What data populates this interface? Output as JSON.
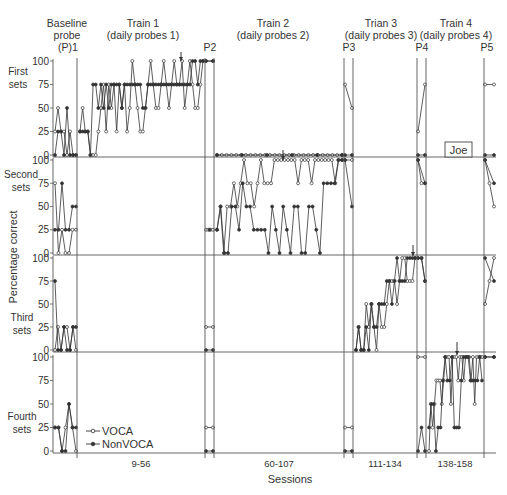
{
  "chart_data": {
    "type": "line",
    "title": "",
    "participant": "Joe",
    "xlabel": "Sessions",
    "ylabel": "Percentage correct",
    "ylim": [
      0,
      100
    ],
    "yticks": [
      0,
      25,
      50,
      75,
      100
    ],
    "grid": false,
    "legend": {
      "position": "lower-left of Fourth sets panel",
      "entries": [
        {
          "name": "VOCA",
          "marker": "open-circle"
        },
        {
          "name": "NonVOCA",
          "marker": "filled-circle"
        }
      ]
    },
    "phases": [
      {
        "id": "baseline",
        "title": "Baseline probe",
        "probe_label": "(P)1",
        "session_range": ""
      },
      {
        "id": "train1",
        "title": "Train 1",
        "subtitle": "(daily probes 1)",
        "probe_label": "P2",
        "session_range": "9-56"
      },
      {
        "id": "train2",
        "title": "Train 2",
        "subtitle": "(daily probes 2)",
        "probe_label": "P3",
        "session_range": "60-107"
      },
      {
        "id": "train3",
        "title": "Trian 3",
        "subtitle": "(daily probes 3)",
        "probe_label": "P4",
        "session_range": "111-134"
      },
      {
        "id": "train4",
        "title": "Train 4",
        "subtitle": "(daily probes 4)",
        "probe_label": "P5",
        "session_range": "138-158"
      }
    ],
    "panels": [
      {
        "name": "First sets",
        "series": [
          {
            "name": "VOCA",
            "segments": {
              "baseline": [
                25,
                50,
                25,
                25,
                0,
                25,
                0,
                0
              ],
              "train1": [
                25,
                50,
                25,
                25,
                0,
                0,
                0,
                25,
                50,
                75,
                25,
                75,
                50,
                75,
                25,
                75,
                50,
                75,
                25,
                50,
                100,
                75,
                50,
                25,
                25,
                50,
                75,
                100,
                75,
                50,
                50,
                75,
                100,
                75,
                50,
                75,
                100,
                75,
                75,
                100,
                50,
                75,
                100,
                75,
                50,
                50,
                75,
                100
              ],
              "p2": [
                100,
                100
              ],
              "train2": [
                0,
                0,
                0,
                0,
                0,
                0,
                0,
                0,
                0,
                0,
                0,
                0,
                0,
                0,
                0,
                0,
                0,
                0,
                0,
                0,
                0,
                0,
                0,
                0,
                0,
                0,
                0
              ],
              "p3": [
                75,
                50
              ],
              "train3": [],
              "p4": [
                25,
                75
              ],
              "train4": [],
              "p5": [
                75,
                75
              ]
            }
          },
          {
            "name": "NonVOCA",
            "segments": {
              "baseline": [
                0,
                25,
                25,
                0,
                50,
                0,
                0,
                0
              ],
              "train1": [
                25,
                25,
                25,
                25,
                0,
                75,
                75,
                50,
                75,
                50,
                75,
                50,
                75,
                75,
                75,
                75,
                50,
                75,
                75,
                75,
                75,
                75,
                75,
                75,
                50,
                50,
                75,
                75,
                75,
                75,
                75,
                75,
                75,
                75,
                75,
                75,
                75,
                75,
                75,
                75,
                75,
                75,
                75,
                100,
                100,
                75,
                100,
                100
              ],
              "p2": [
                100,
                100
              ],
              "train2": [
                0,
                0,
                0,
                0,
                0,
                0
              ],
              "p3": [
                0,
                0
              ],
              "train3": [],
              "p4": [
                0,
                0
              ],
              "train4": [],
              "p5": [
                0,
                0
              ]
            }
          }
        ]
      },
      {
        "name": "Second sets",
        "series": [
          {
            "name": "VOCA",
            "segments": {
              "baseline": [
                75,
                0,
                25,
                0,
                0,
                25,
                25
              ],
              "p2": [
                25,
                25,
                25,
                25
              ],
              "train2": [
                25,
                50,
                0,
                50,
                50,
                75,
                50,
                75,
                100,
                75,
                75,
                50,
                75,
                100,
                75,
                75,
                75,
                100,
                100,
                100,
                100,
                100,
                100,
                100,
                75,
                100,
                100,
                100,
                75,
                100,
                100,
                100,
                100,
                100,
                100,
                75,
                100,
                100
              ],
              "p3": [
                100,
                100
              ],
              "p4": [
                100,
                75,
                75
              ],
              "p5": [
                100,
                75,
                50
              ]
            }
          },
          {
            "name": "NonVOCA",
            "segments": {
              "baseline": [
                25,
                25,
                75,
                25,
                25,
                50,
                50
              ],
              "p2": [
                25
              ],
              "train2": [
                25,
                50,
                0,
                0,
                50,
                50,
                25,
                75,
                50,
                50,
                25,
                25,
                25,
                25,
                0,
                50,
                25,
                0,
                50,
                25,
                0,
                50,
                50,
                0,
                0,
                50,
                50,
                25,
                0,
                75,
                75,
                75,
                75,
                100,
                100
              ],
              "p3": [
                100,
                50
              ],
              "p4": [
                100,
                75
              ],
              "p5": [
                100,
                75
              ]
            }
          }
        ]
      },
      {
        "name": "Third sets",
        "series": [
          {
            "name": "VOCA",
            "segments": {
              "baseline": [
                0,
                25,
                0,
                25,
                25,
                0,
                25,
                0
              ],
              "p2": [
                25,
                25
              ],
              "train3": [
                0,
                25,
                0,
                0,
                50,
                25,
                50,
                25,
                0,
                50,
                25,
                25,
                50,
                75,
                75,
                75,
                50,
                75,
                100,
                100,
                75,
                75,
                75,
                100
              ],
              "p4": [
                100,
                100,
                75
              ],
              "p5": [
                50,
                75,
                100
              ]
            }
          },
          {
            "name": "NonVOCA",
            "segments": {
              "baseline": [
                75,
                0,
                0,
                25,
                0,
                0,
                25,
                25
              ],
              "p2": [
                0,
                0
              ],
              "train3": [
                0,
                25,
                0,
                0,
                25,
                0,
                50,
                25,
                25,
                50,
                50,
                50,
                75,
                75,
                50,
                75,
                100,
                75,
                75,
                75,
                100,
                100,
                100,
                100
              ],
              "p4": [
                100,
                100,
                75
              ],
              "p5": [
                100,
                75
              ]
            }
          }
        ]
      },
      {
        "name": "Fourth sets",
        "series": [
          {
            "name": "VOCA",
            "segments": {
              "baseline": [
                25,
                25,
                0,
                25,
                50,
                25,
                0
              ],
              "p2": [
                25,
                25
              ],
              "p3": [
                25,
                25
              ],
              "p4": [
                100,
                100
              ],
              "train4": [
                0,
                50,
                25,
                50,
                75,
                75,
                75,
                50,
                75,
                100,
                100,
                100,
                50,
                100,
                100,
                100,
                75,
                100,
                100,
                75,
                100,
                100,
                100,
                75,
                100,
                50,
                100,
                100,
                100,
                100
              ],
              "p5": [
                100,
                100
              ]
            }
          },
          {
            "name": "NonVOCA",
            "segments": {
              "baseline": [
                25,
                25,
                0,
                0,
                50,
                25,
                25
              ],
              "p2": [
                0,
                0
              ],
              "p3": [
                0,
                0
              ],
              "p4": [
                0,
                25,
                0
              ],
              "train4": [
                25,
                50,
                50,
                0,
                25,
                25,
                75,
                100,
                75,
                75,
                100,
                25,
                25,
                25,
                75,
                100,
                100,
                100,
                75,
                75,
                75,
                75,
                100,
                75
              ],
              "p5": [
                100,
                100
              ]
            }
          }
        ]
      }
    ],
    "annotations": [
      {
        "type": "arrow",
        "panel": "First sets",
        "phase": "train1",
        "note": "criterion marker near session ~48"
      },
      {
        "type": "arrow",
        "panel": "Second sets",
        "phase": "train2",
        "note": "criterion marker near session ~80"
      },
      {
        "type": "arrow",
        "panel": "Third sets",
        "phase": "train3",
        "note": "criterion marker near session ~131"
      },
      {
        "type": "arrow",
        "panel": "Fourth sets",
        "phase": "train4",
        "note": "criterion marker near session ~147"
      }
    ]
  },
  "labels": {
    "phase_titles": [
      {
        "line1": "Baseline",
        "line2": "probe"
      },
      {
        "line1": "Train 1",
        "line2": "(daily probes 1)"
      },
      {
        "line1": "Train 2",
        "line2": "(daily probes 2)"
      },
      {
        "line1": "Trian 3",
        "line2": "(daily probes 3)"
      },
      {
        "line1": "Train 4",
        "line2": "(daily probes 4)"
      }
    ],
    "probe_labels": [
      "(P)1",
      "P2",
      "P3",
      "P4",
      "P5"
    ],
    "set_labels": [
      {
        "line1": "First",
        "line2": "sets"
      },
      {
        "line1": "Second",
        "line2": "sets"
      },
      {
        "line1": "Third",
        "line2": "sets"
      },
      {
        "line1": "Fourth",
        "line2": "sets"
      }
    ],
    "ticks": [
      "0",
      "25",
      "50",
      "75",
      "100"
    ],
    "ranges": [
      "9-56",
      "60-107",
      "111-134",
      "138-158"
    ],
    "xlabel": "Sessions",
    "ylabel": "Percentage correct",
    "participant": "Joe",
    "legend": [
      "VOCA",
      "NonVOCA"
    ]
  },
  "colors": {
    "ink": "#333333",
    "axis": "#555555",
    "background": "#ffffff"
  }
}
